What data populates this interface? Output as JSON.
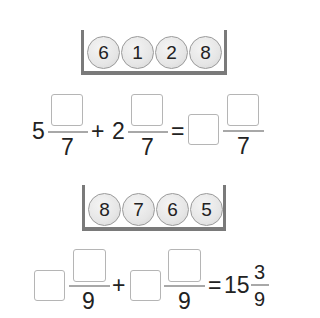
{
  "problem1": {
    "tray_balls": [
      "6",
      "1",
      "2",
      "8"
    ],
    "addend1": {
      "whole": "5",
      "numerator": "",
      "denominator": "7"
    },
    "plus": "+",
    "addend2": {
      "whole": "2",
      "numerator": "",
      "denominator": "7"
    },
    "equals": "=",
    "result": {
      "whole": "",
      "numerator": "",
      "denominator": "7"
    }
  },
  "problem2": {
    "tray_balls": [
      "8",
      "7",
      "6",
      "5"
    ],
    "addend1": {
      "whole": "",
      "numerator": "",
      "denominator": "9"
    },
    "plus": "+",
    "addend2": {
      "whole": "",
      "numerator": "",
      "denominator": "9"
    },
    "equals": "=",
    "result": {
      "whole": "15",
      "numerator": "3",
      "denominator": "9"
    }
  },
  "colors": {
    "tray": "#7a7a7a",
    "box_border": "#b5b5b5",
    "ball": "#e6e6e6"
  }
}
